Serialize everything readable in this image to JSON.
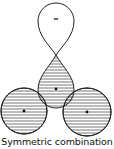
{
  "diagram": {
    "caption": "Symmetric combination",
    "colors": {
      "stroke": "#222222",
      "hatch": "#555555",
      "background": "#ffffff"
    },
    "lobes": [
      {
        "id": "top-lobe",
        "sign": "-",
        "shaded": false
      },
      {
        "id": "center-lobe",
        "sign": "+",
        "shaded": true
      },
      {
        "id": "left-orbital",
        "sign": "+",
        "shaded": true
      },
      {
        "id": "right-orbital",
        "sign": "+",
        "shaded": true
      }
    ],
    "top_lobe_sign": "-"
  }
}
